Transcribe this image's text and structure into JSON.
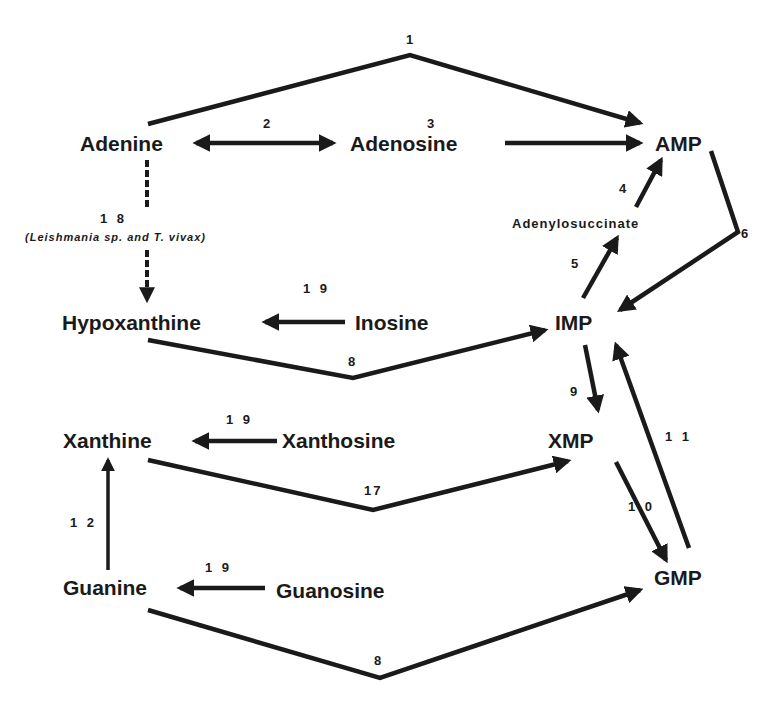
{
  "diagram": {
    "type": "metabolic-pathway",
    "nodes": {
      "adenine": "Adenine",
      "adenosine": "Adenosine",
      "amp": "AMP",
      "adenylosuccinate": "Adenylosuccinate",
      "hypoxanthine": "Hypoxanthine",
      "inosine": "Inosine",
      "imp": "IMP",
      "xanthine": "Xanthine",
      "xanthosine": "Xanthosine",
      "xmp": "XMP",
      "guanine": "Guanine",
      "guanosine": "Guanosine",
      "gmp": "GMP"
    },
    "reactions": {
      "r1": "1",
      "r2": "2",
      "r3": "3",
      "r4": "4",
      "r5": "5",
      "r6": "6",
      "r8_hypox": "8",
      "r8_guan": "8",
      "r9": "9",
      "r10": "1 0",
      "r11": "1 1",
      "r12": "1 2",
      "r17": "17",
      "r18": "1 8",
      "r18_note": "(Leishmania sp. and T. vivax)",
      "r19_inosine": "1 9",
      "r19_xanthosine": "1 9",
      "r19_guanosine": "1 9"
    },
    "edges": [
      {
        "id": "1",
        "from": "Adenine",
        "to": "AMP"
      },
      {
        "id": "2",
        "from": "Adenine",
        "to": "Adenosine",
        "bidirectional": true
      },
      {
        "id": "3",
        "from": "Adenosine",
        "to": "AMP"
      },
      {
        "id": "4",
        "from": "Adenylosuccinate",
        "to": "AMP"
      },
      {
        "id": "5",
        "from": "IMP",
        "to": "Adenylosuccinate"
      },
      {
        "id": "6",
        "from": "AMP",
        "to": "IMP"
      },
      {
        "id": "8",
        "from": "Hypoxanthine",
        "to": "IMP"
      },
      {
        "id": "8",
        "from": "Guanine",
        "to": "GMP"
      },
      {
        "id": "9",
        "from": "IMP",
        "to": "XMP"
      },
      {
        "id": "10",
        "from": "XMP",
        "to": "GMP"
      },
      {
        "id": "11",
        "from": "GMP",
        "to": "IMP"
      },
      {
        "id": "12",
        "from": "Guanine",
        "to": "Xanthine"
      },
      {
        "id": "17",
        "from": "Xanthine",
        "to": "XMP"
      },
      {
        "id": "18",
        "from": "Adenine",
        "to": "Hypoxanthine",
        "dashed": true,
        "note": "(Leishmania sp. and T. vivax)"
      },
      {
        "id": "19",
        "from": "Inosine",
        "to": "Hypoxanthine"
      },
      {
        "id": "19",
        "from": "Xanthosine",
        "to": "Xanthine"
      },
      {
        "id": "19",
        "from": "Guanosine",
        "to": "Guanine"
      }
    ]
  }
}
